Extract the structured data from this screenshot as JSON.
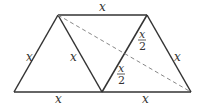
{
  "diagram": {
    "type": "geometry-figure",
    "vertices": {
      "top_left": [
        58,
        15
      ],
      "top_right": [
        147,
        15
      ],
      "bottom_left": [
        14,
        92
      ],
      "bottom_middle": [
        102,
        92
      ],
      "bottom_right": [
        191,
        92
      ]
    },
    "labels": {
      "top": "x",
      "left_side": "x",
      "inner_left": "x",
      "right_side": "x",
      "bottom_left": "x",
      "bottom_right": "x",
      "inner_upper_half_num": "x",
      "inner_upper_half_den": "2",
      "inner_lower_half_num": "x",
      "inner_lower_half_den": "2"
    },
    "colors": {
      "stroke": "#333333",
      "dashed": "#888888"
    }
  }
}
